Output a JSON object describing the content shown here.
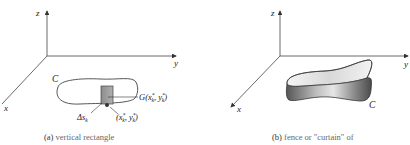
{
  "panel_a": {
    "axes": {
      "z": "z",
      "y": "y",
      "x": "x"
    },
    "curve_label": "C",
    "point_G_label": "G(x",
    "point_G_sub": "k",
    "point_G_sup": "*",
    "point_G_mid": ", y",
    "point_G_end": ")",
    "delta_label": "Δs",
    "delta_sub": "k",
    "point_label": "(x",
    "point_sub": "k",
    "point_sup": "*",
    "point_mid": ", y",
    "point_end": ")",
    "caption_tag": "(a)",
    "caption_text": " vertical rectangle"
  },
  "panel_b": {
    "axes": {
      "z": "z",
      "y": "y",
      "x": "x"
    },
    "curve_label": "C",
    "caption_tag": "(b)",
    "caption_text": " fence or \"curtain\" of"
  },
  "colors": {
    "axis": "#444444",
    "rect_fill": "#9a9a9a",
    "curtain_dark": "#6a6a6a",
    "curtain_light": "#e8e8e8"
  }
}
